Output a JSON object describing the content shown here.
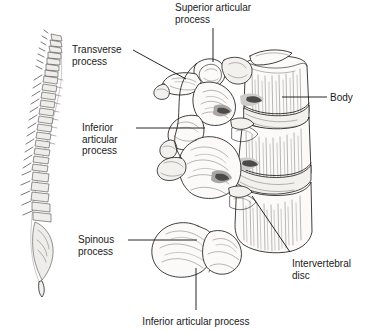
{
  "figure": {
    "background_color": "#ffffff",
    "ink_color": "#1c1c1c",
    "illustrations": [
      {
        "name": "vertebral-column-lateral",
        "description": "Full spinal column shown in left lateral view"
      },
      {
        "name": "lumbar-vertebrae-detail",
        "description": "Two articulated lumbar vertebrae with intervertebral disc, lateral-oblique view"
      }
    ]
  },
  "labels": [
    {
      "id": "superior-articular-process",
      "text": "Superior articular\nprocess",
      "align": "left",
      "x": 175,
      "y": 2
    },
    {
      "id": "transverse-process",
      "text": "Transverse\nprocess",
      "align": "left",
      "x": 72,
      "y": 44
    },
    {
      "id": "body",
      "text": "Body",
      "align": "left",
      "x": 330,
      "y": 92
    },
    {
      "id": "inferior-articular-process",
      "text": "Inferior\narticular\nprocess",
      "align": "left",
      "x": 82,
      "y": 122
    },
    {
      "id": "spinous-process",
      "text": "Spinous\nprocess",
      "align": "left",
      "x": 78,
      "y": 234
    },
    {
      "id": "intervertebral-disc",
      "text": "Intervertebral\ndisc",
      "align": "left",
      "x": 292,
      "y": 258
    },
    {
      "id": "inferior-articular-process-bottom",
      "text": "Inferior articular process",
      "align": "center",
      "x": 196,
      "y": 316
    }
  ],
  "leader_lines": [
    {
      "id": "leader-superior-articular-process",
      "from": [
        213,
        28
      ],
      "to": [
        213,
        62
      ]
    },
    {
      "id": "leader-transverse-process",
      "from": [
        133,
        50
      ],
      "to": [
        186,
        79
      ]
    },
    {
      "id": "leader-body",
      "from": [
        327,
        97
      ],
      "to": [
        282,
        97
      ]
    },
    {
      "id": "leader-inferior-articular-process",
      "from": [
        136,
        128
      ],
      "to": [
        205,
        128
      ]
    },
    {
      "id": "leader-spinous-process",
      "from": [
        128,
        240
      ],
      "to": [
        197,
        240
      ]
    },
    {
      "id": "leader-intervertebral-disc",
      "from": [
        290,
        252
      ],
      "to": [
        252,
        196
      ]
    },
    {
      "id": "leader-inferior-articular-process-bottom",
      "from": [
        196,
        268
      ],
      "to": [
        196,
        310
      ]
    }
  ]
}
